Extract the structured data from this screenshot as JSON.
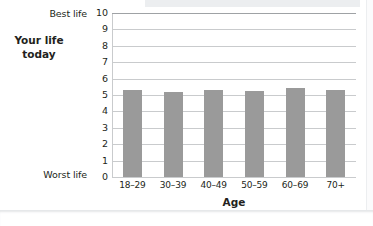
{
  "chart_data": {
    "type": "bar",
    "title": "",
    "xlabel": "Age",
    "ylabel": "Your life today",
    "categories": [
      "18–29",
      "30–39",
      "40–49",
      "50–59",
      "60–69",
      "70+"
    ],
    "values": [
      5.3,
      5.2,
      5.3,
      5.25,
      5.4,
      5.3
    ],
    "ylim": [
      0,
      10
    ],
    "ytick_labels": [
      "0",
      "1",
      "2",
      "3",
      "4",
      "5",
      "6",
      "7",
      "8",
      "9",
      "10"
    ],
    "yaxis_endpoint_labels": {
      "max": "Best life",
      "min": "Worst life"
    },
    "grid": true,
    "legend": "none",
    "bar_color": "#9a9a9a",
    "grid_color": "#c9cbcd"
  },
  "axes": {
    "y_caption_top": "Best life",
    "y_caption_bottom": "Worst life",
    "y_axis_title": "Your life\ntoday",
    "y_axis_title_line1": "Your life",
    "y_axis_title_line2": "today",
    "x_axis_title": "Age"
  }
}
